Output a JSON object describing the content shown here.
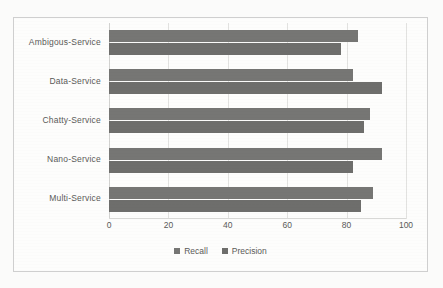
{
  "chart_data": {
    "type": "bar",
    "orientation": "horizontal",
    "title": "",
    "xlabel": "",
    "ylabel": "",
    "categories": [
      "Ambigous-Service",
      "Data-Service",
      "Chatty-Service",
      "Nano-Service",
      "Multi-Service"
    ],
    "series": [
      {
        "name": "Recall",
        "values": [
          84,
          82,
          88,
          92,
          89
        ],
        "color": "#767674"
      },
      {
        "name": "Precision",
        "values": [
          78,
          92,
          86,
          82,
          85
        ],
        "color": "#6e6e6c"
      }
    ],
    "xlim": [
      0,
      100
    ],
    "xticks": [
      0,
      20,
      40,
      60,
      80,
      100
    ],
    "xtick_labels": [
      "0",
      "20",
      "40",
      "60",
      "80",
      "100"
    ],
    "grid": true,
    "grid_axis": "x",
    "legend": [
      "Recall",
      "Precision"
    ],
    "legend_position": "bottom",
    "background_color": "#fdfdfc",
    "border_color": "#cfcfcf"
  }
}
